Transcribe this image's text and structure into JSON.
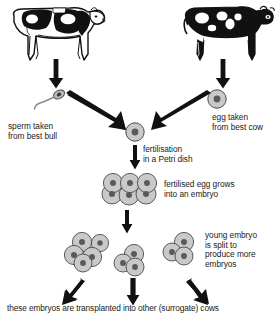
{
  "diagram": {
    "title_text_present": false,
    "labels": {
      "sperm": "sperm taken\nfrom best bull",
      "egg": "egg taken\nfrom best cow",
      "fertilisation": "fertilisation\nin a Petri dish",
      "embryo_growth": "fertilised egg grows\ninto an embryo",
      "embryo_split": "young embryo\nis split to\nproduce more\nembryos",
      "transplant": "these embryos are transplanted into other (surrogate) cows"
    },
    "nodes": {
      "bull": {
        "name": "dairy-bull-illustration"
      },
      "cow": {
        "name": "dairy-cow-illustration"
      },
      "sperm": {
        "name": "sperm-cell"
      },
      "egg": {
        "name": "egg-cell"
      },
      "fertilised_egg": {
        "name": "fertilised-egg-cell"
      },
      "embryo": {
        "name": "embryo-six-cells",
        "cell_count": 6
      },
      "split_left": {
        "name": "split-embryo-left",
        "cell_count": 5
      },
      "split_middle": {
        "name": "split-embryo-middle",
        "cell_count": 3
      },
      "split_right": {
        "name": "split-embryo-right",
        "cell_count": 3
      }
    },
    "arrows": {
      "bull_to_sperm": "arrow-down",
      "cow_to_egg": "arrow-down",
      "sperm_to_fertilisation": "arrow-diagonal-right-down",
      "egg_to_fertilisation": "arrow-diagonal-left-down",
      "fertilisation_to_embryo": "arrow-down",
      "embryo_to_split": "arrow-down",
      "split_to_transplant_left": "arrow-diagonal-left-down",
      "split_to_transplant_middle": "arrow-down",
      "split_to_transplant_right": "arrow-diagonal-right-down"
    },
    "colors": {
      "ink": "#111111",
      "cell_fill": "#c9c9c9",
      "cell_stroke": "#4a4a4a",
      "nucleus": "#555555",
      "text": "#1a1a1a",
      "background": "#ffffff"
    }
  }
}
